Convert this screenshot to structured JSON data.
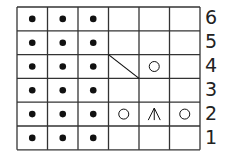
{
  "chart": {
    "type": "knitting-chart",
    "columns": 6,
    "rows": 6,
    "row_labels": [
      "6",
      "5",
      "4",
      "3",
      "2",
      "1"
    ],
    "legend_symbols": {
      "dot": "purl",
      "circle": "yarn-over",
      "diagonal": "cable/slant",
      "central-decrease": "central double decrease"
    },
    "grid": [
      [
        "dot",
        "dot",
        "dot",
        "",
        "",
        ""
      ],
      [
        "dot",
        "dot",
        "dot",
        "",
        "",
        ""
      ],
      [
        "dot",
        "dot",
        "dot",
        "diagonal",
        "circle",
        ""
      ],
      [
        "dot",
        "dot",
        "dot",
        "",
        "",
        ""
      ],
      [
        "dot",
        "dot",
        "dot",
        "circle",
        "central-decrease",
        "circle"
      ],
      [
        "dot",
        "dot",
        "dot",
        "",
        "",
        ""
      ]
    ],
    "colors": {
      "line": "#333333",
      "symbol": "#111111",
      "background": "#ffffff"
    }
  }
}
